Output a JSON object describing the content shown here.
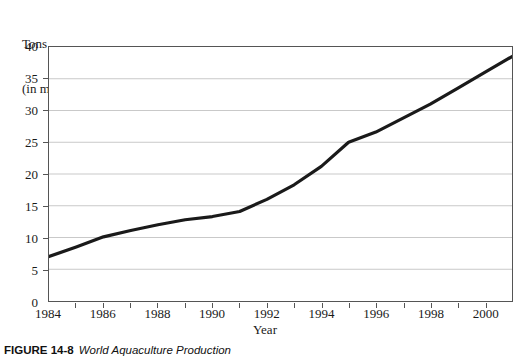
{
  "chart_data": {
    "type": "line",
    "title": "",
    "xlabel": "Year",
    "ylabel": "Tons\n(in millions)",
    "ylabel_line1": "Tons",
    "ylabel_line2": "(in millions)",
    "xlim": [
      1984,
      2001
    ],
    "ylim": [
      0,
      40
    ],
    "ytick_step": 5,
    "xtick_step": 1,
    "xlabel_step": 2,
    "grid": "horizontal",
    "legend": "none",
    "line_color": "#1a1a1a",
    "grid_color": "#c9c9c9",
    "axis_color": "#555555",
    "background": "#ffffff",
    "yticks": [
      0,
      5,
      10,
      15,
      20,
      25,
      30,
      35,
      40
    ],
    "ytick_labels": [
      "0",
      "5",
      "10",
      "15",
      "20",
      "25",
      "30",
      "35",
      "40"
    ],
    "xticks": [
      1984,
      1985,
      1986,
      1987,
      1988,
      1989,
      1990,
      1991,
      1992,
      1993,
      1994,
      1995,
      1996,
      1997,
      1998,
      1999,
      2000,
      2001
    ],
    "xtick_labels": [
      "1984",
      "",
      "1986",
      "",
      "1988",
      "",
      "1990",
      "",
      "1992",
      "",
      "1994",
      "",
      "1996",
      "",
      "1998",
      "",
      "2000",
      ""
    ],
    "series": [
      {
        "name": "World Aquaculture Production",
        "x": [
          1984,
          1985,
          1986,
          1987,
          1988,
          1989,
          1990,
          1991,
          1992,
          1993,
          1994,
          1995,
          1996,
          1997,
          1998,
          1999,
          2000,
          2001
        ],
        "values": [
          7.0,
          8.5,
          10.1,
          11.1,
          12.0,
          12.8,
          13.3,
          14.1,
          16.0,
          18.3,
          21.2,
          25.0,
          26.6,
          28.8,
          31.0,
          33.5,
          36.0,
          38.5
        ]
      }
    ]
  },
  "caption": {
    "label": "FIGURE 14-8",
    "title": "World Aquaculture Production"
  }
}
